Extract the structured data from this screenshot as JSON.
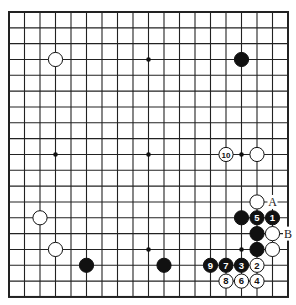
{
  "board": {
    "size": 19,
    "origin_x": 9,
    "origin_y": 12,
    "step_x": 15.5,
    "step_y": 15.83,
    "line_color": "#222222",
    "background": "#ffffff",
    "hoshi": [
      [
        3,
        9
      ],
      [
        9,
        3
      ],
      [
        9,
        9
      ],
      [
        9,
        15
      ],
      [
        15,
        9
      ],
      [
        15,
        15
      ],
      [
        3,
        15
      ],
      [
        15,
        3
      ],
      [
        3,
        3
      ]
    ],
    "stones": [
      {
        "col": 3,
        "row": 3,
        "color": "white",
        "label": ""
      },
      {
        "col": 15,
        "row": 3,
        "color": "black",
        "label": ""
      },
      {
        "col": 14,
        "row": 9,
        "color": "white",
        "label": "10"
      },
      {
        "col": 16,
        "row": 9,
        "color": "white",
        "label": ""
      },
      {
        "col": 16,
        "row": 12,
        "color": "white",
        "label": ""
      },
      {
        "col": 15,
        "row": 13,
        "color": "black",
        "label": ""
      },
      {
        "col": 16,
        "row": 13,
        "color": "black",
        "label": "5"
      },
      {
        "col": 17,
        "row": 13,
        "color": "black",
        "label": "1"
      },
      {
        "col": 2,
        "row": 13,
        "color": "white",
        "label": ""
      },
      {
        "col": 16,
        "row": 14,
        "color": "black",
        "label": ""
      },
      {
        "col": 17,
        "row": 14,
        "color": "white",
        "label": ""
      },
      {
        "col": 16,
        "row": 15,
        "color": "black",
        "label": ""
      },
      {
        "col": 17,
        "row": 15,
        "color": "white",
        "label": ""
      },
      {
        "col": 3,
        "row": 15,
        "color": "white",
        "label": ""
      },
      {
        "col": 5,
        "row": 16,
        "color": "black",
        "label": ""
      },
      {
        "col": 10,
        "row": 16,
        "color": "black",
        "label": ""
      },
      {
        "col": 13,
        "row": 16,
        "color": "black",
        "label": "9"
      },
      {
        "col": 14,
        "row": 16,
        "color": "black",
        "label": "7"
      },
      {
        "col": 15,
        "row": 16,
        "color": "black",
        "label": "3"
      },
      {
        "col": 16,
        "row": 16,
        "color": "white",
        "label": "2"
      },
      {
        "col": 14,
        "row": 17,
        "color": "white",
        "label": "8"
      },
      {
        "col": 15,
        "row": 17,
        "color": "white",
        "label": "6"
      },
      {
        "col": 16,
        "row": 17,
        "color": "white",
        "label": "4"
      }
    ],
    "markers": [
      {
        "col": 17,
        "row": 12,
        "label": "A"
      },
      {
        "col": 18,
        "row": 14,
        "label": "B"
      }
    ]
  }
}
